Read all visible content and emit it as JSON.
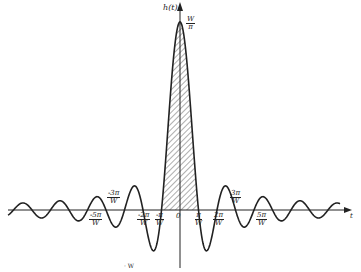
{
  "figure": {
    "y_axis_label": "h(t)",
    "x_axis_label": "t",
    "peak_label": {
      "num": "W",
      "den": "π"
    },
    "origin_label": "0",
    "tick_labels_below": [
      {
        "id": "m5",
        "num": "-5π",
        "den": "W",
        "x": 97,
        "y": 212
      },
      {
        "id": "m2",
        "num": "-2π",
        "den": "W",
        "x": 145,
        "y": 212
      },
      {
        "id": "m1",
        "num": "-π",
        "den": "W",
        "x": 163,
        "y": 212
      },
      {
        "id": "p1",
        "num": "π",
        "den": "W",
        "x": 203,
        "y": 212
      },
      {
        "id": "p2",
        "num": "2π",
        "den": "W",
        "x": 221,
        "y": 212
      },
      {
        "id": "p5",
        "num": "5π",
        "den": "W",
        "x": 264,
        "y": 212
      }
    ],
    "tick_labels_above": [
      {
        "id": "m3",
        "num": "-3π",
        "den": "W",
        "x": 115,
        "y": 190
      },
      {
        "id": "p3",
        "num": "3π",
        "den": "W",
        "x": 238,
        "y": 190
      }
    ],
    "caption_fragment": "· W",
    "colors": {
      "ink": "#222222",
      "background": "#ffffff"
    }
  },
  "chart_data": {
    "type": "line",
    "title": "",
    "function": "h(t) = sin(Wt)/(πt)",
    "xlabel": "t",
    "ylabel": "h(t)",
    "peak_value": "W/π",
    "zero_crossings": [
      "±π/W",
      "±2π/W",
      "±3π/W",
      "±4π/W",
      "±5π/W",
      "±6π/W",
      "±7π/W",
      "±8π/W",
      "±9π/W"
    ],
    "shaded_region": "main lobe between -π/W and π/W (hatched)",
    "x_tick_labels": [
      "-5π/W",
      "-3π/W",
      "-2π/W",
      "-π/W",
      "0",
      "π/W",
      "2π/W",
      "3π/W",
      "5π/W"
    ],
    "grid": false,
    "legend": null
  }
}
